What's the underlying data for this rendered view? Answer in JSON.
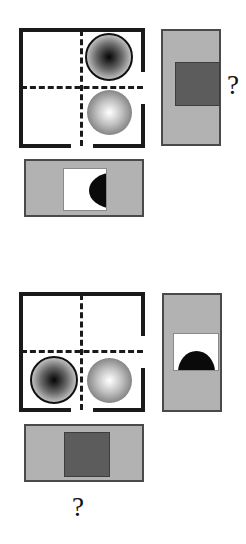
{
  "page": {
    "type": "visual-analogy-puzzle",
    "background_color": "#ffffff",
    "width": 246,
    "height": 544,
    "question_mark_glyph": "?"
  },
  "palette": {
    "ink": "#1a1a1a",
    "panel_gray": "#b2b2b2",
    "panel_border": "#4a4a4a",
    "dark_square": "#5c5c5c",
    "white": "#ffffff",
    "black_shape": "#0a0a0a"
  },
  "groups": [
    {
      "id": "group-top",
      "name": "top-analogy-row",
      "frame": {
        "name": "bracket-frame-top",
        "style": "corner-bracket square with dashed crosshair",
        "quadrant_labels": [
          "upper-left",
          "upper-right",
          "lower-left",
          "lower-right"
        ],
        "objects": [
          {
            "name": "sphere-concave",
            "shading": "concave",
            "quadrant": "upper-right"
          },
          {
            "name": "sphere-convex",
            "shading": "convex",
            "quadrant": "lower-right"
          }
        ]
      },
      "side_panel": {
        "name": "vertical-gray-panel-top",
        "orientation": "vertical",
        "fill": "#b2b2b2",
        "inset_shape": {
          "name": "dark-square-inset",
          "kind": "square",
          "fill": "#5c5c5c"
        }
      },
      "bottom_panel": {
        "name": "horizontal-gray-panel-top",
        "orientation": "horizontal",
        "fill": "#b2b2b2",
        "inset_shape": {
          "name": "white-box-with-half-disc",
          "kind": "white square containing black half-disc",
          "half_disc_flat_side": "right"
        }
      },
      "answer_slot": {
        "name": "answer-question-mark-top",
        "label": "?",
        "position": "right of vertical panel"
      }
    },
    {
      "id": "group-bottom",
      "name": "bottom-analogy-row",
      "frame": {
        "name": "bracket-frame-bottom",
        "style": "corner-bracket square with dashed crosshair",
        "quadrant_labels": [
          "upper-left",
          "upper-right",
          "lower-left",
          "lower-right"
        ],
        "objects": [
          {
            "name": "sphere-concave",
            "shading": "concave",
            "quadrant": "lower-left"
          },
          {
            "name": "sphere-convex",
            "shading": "convex",
            "quadrant": "lower-right"
          }
        ]
      },
      "side_panel": {
        "name": "vertical-gray-panel-bottom",
        "orientation": "vertical",
        "fill": "#b2b2b2",
        "inset_shape": {
          "name": "white-box-with-half-disc",
          "kind": "white square containing black half-disc",
          "half_disc_flat_side": "bottom"
        }
      },
      "bottom_panel": {
        "name": "horizontal-gray-panel-bottom",
        "orientation": "horizontal",
        "fill": "#b2b2b2",
        "inset_shape": {
          "name": "dark-square-inset",
          "kind": "square",
          "fill": "#5c5c5c"
        }
      },
      "answer_slot": {
        "name": "answer-question-mark-bottom",
        "label": "?",
        "position": "below horizontal panel"
      }
    }
  ]
}
